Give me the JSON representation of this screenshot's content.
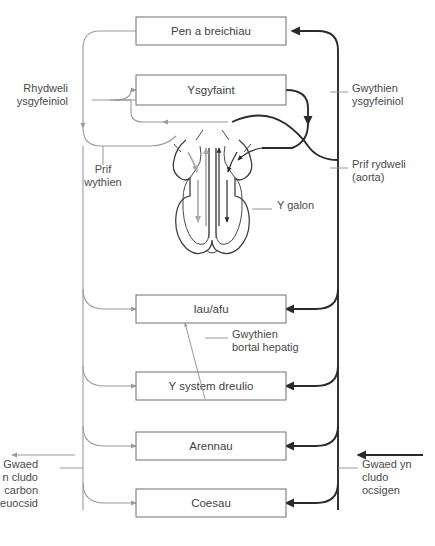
{
  "diagram": {
    "language": "cy",
    "colors": {
      "oxygenated": "#2b2b2b",
      "deoxygenated": "#9a9a9a",
      "box_stroke": "#6f6f6f",
      "text": "#3f3f3f",
      "background": "#ffffff"
    }
  },
  "boxes": [
    {
      "id": "head_arms",
      "label": "Pen a breichiau",
      "x": 136,
      "y": 17,
      "w": 150,
      "h": 28
    },
    {
      "id": "lungs",
      "label": "Ysgyfaint",
      "x": 136,
      "y": 75,
      "w": 150,
      "h": 30
    },
    {
      "id": "liver",
      "label": "Iau/afu",
      "x": 136,
      "y": 295,
      "w": 150,
      "h": 28
    },
    {
      "id": "digestive",
      "label": "Y system dreulio",
      "x": 136,
      "y": 372,
      "w": 150,
      "h": 28
    },
    {
      "id": "kidneys",
      "label": "Arennau",
      "x": 136,
      "y": 432,
      "w": 150,
      "h": 28
    },
    {
      "id": "legs",
      "label": "Coesau",
      "x": 136,
      "y": 489,
      "w": 150,
      "h": 28
    }
  ],
  "annotations": [
    {
      "id": "pulmonary_artery",
      "lines": [
        "Rhydweli",
        "ysgyfeiniol"
      ],
      "side": "left",
      "x": 68,
      "y": 92
    },
    {
      "id": "vena_cava",
      "lines": [
        "Prif",
        "wythien"
      ],
      "side": "center",
      "x": 103,
      "y": 173
    },
    {
      "id": "pulmonary_vein",
      "lines": [
        "Gwythien",
        "ysgyfeiniol"
      ],
      "side": "right",
      "x": 352,
      "y": 92
    },
    {
      "id": "aorta",
      "lines": [
        "Prif rydweli",
        "(aorta)"
      ],
      "side": "right",
      "x": 352,
      "y": 168
    },
    {
      "id": "heart",
      "lines": [
        "Y galon"
      ],
      "side": "right",
      "x": 277,
      "y": 209
    },
    {
      "id": "hepatic_portal",
      "lines": [
        "Gwythien",
        "bortal hepatig"
      ],
      "side": "right",
      "x": 232,
      "y": 338
    },
    {
      "id": "deoxy_key",
      "lines": [
        "Gwaed",
        "n cludo",
        "carbon",
        "deuocsid"
      ],
      "side": "left-key",
      "x": 38,
      "y": 468
    },
    {
      "id": "oxy_key",
      "lines": [
        "Gwaed yn",
        "cludo",
        "ocsigen"
      ],
      "side": "right-key",
      "x": 362,
      "y": 468
    }
  ],
  "key": {
    "deoxygenated_label": "Gwaed yn cludo carbon deuocsid",
    "oxygenated_label": "Gwaed yn cludo ocsigen"
  },
  "flow": {
    "vein_trunk_x": 83,
    "artery_trunk_x": 338,
    "direction_deoxy": "left-outbound",
    "direction_oxy": "right-inbound"
  }
}
